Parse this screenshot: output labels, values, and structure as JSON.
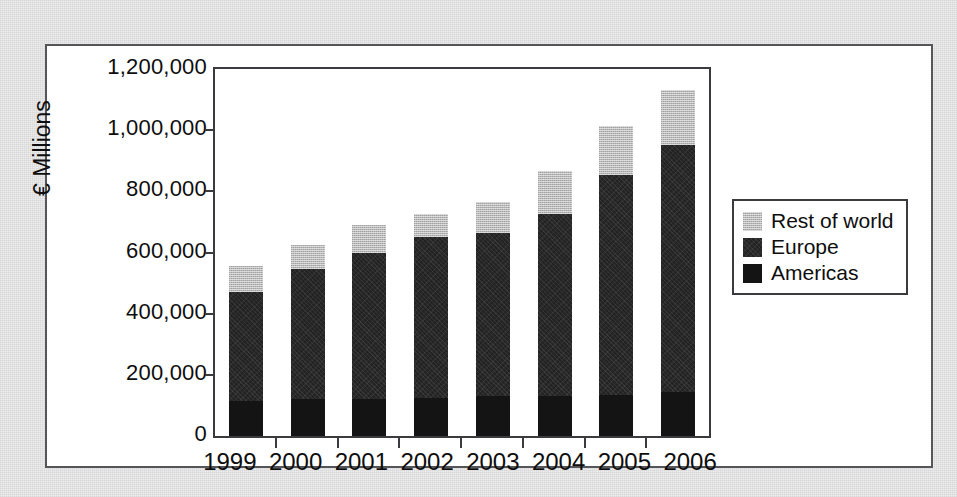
{
  "chart_data": {
    "type": "bar",
    "subtype": "stacked-bar",
    "title": "",
    "xlabel": "",
    "ylabel": "€ Millions",
    "categories": [
      "1999",
      "2000",
      "2001",
      "2002",
      "2003",
      "2004",
      "2005",
      "2006"
    ],
    "series": [
      {
        "name": "Americas",
        "color": "#141414",
        "values": [
          115000,
          120000,
          120000,
          125000,
          130000,
          130000,
          135000,
          145000
        ]
      },
      {
        "name": "Europe",
        "color": "#232323",
        "values": [
          355000,
          425000,
          480000,
          525000,
          535000,
          595000,
          720000,
          805000
        ]
      },
      {
        "name": "Rest of world",
        "color": "#b9b9b9",
        "values": [
          85000,
          80000,
          90000,
          75000,
          100000,
          140000,
          160000,
          180000
        ]
      }
    ],
    "stack_order_bottom_to_top": [
      "Americas",
      "Europe",
      "Rest of world"
    ],
    "cumulative_tops": {
      "americas": [
        115000,
        120000,
        120000,
        125000,
        130000,
        130000,
        135000,
        145000
      ],
      "europe": [
        470000,
        545000,
        600000,
        650000,
        665000,
        725000,
        855000,
        950000
      ],
      "total": [
        555000,
        625000,
        690000,
        725000,
        765000,
        865000,
        1015000,
        1130000
      ]
    },
    "ylim": [
      0,
      1200000
    ],
    "ytick_values": [
      0,
      200000,
      400000,
      600000,
      800000,
      1000000,
      1200000
    ],
    "ytick_labels": [
      "0",
      "200,000",
      "400,000",
      "600,000",
      "800,000",
      "1,000,000",
      "1,200,000"
    ],
    "grid": false,
    "legend_position": "right",
    "legend_entries": [
      {
        "label": "Rest of world",
        "swatch": "#b9b9b9"
      },
      {
        "label": "Europe",
        "swatch": "#232323"
      },
      {
        "label": "Americas",
        "swatch": "#141414"
      }
    ]
  }
}
